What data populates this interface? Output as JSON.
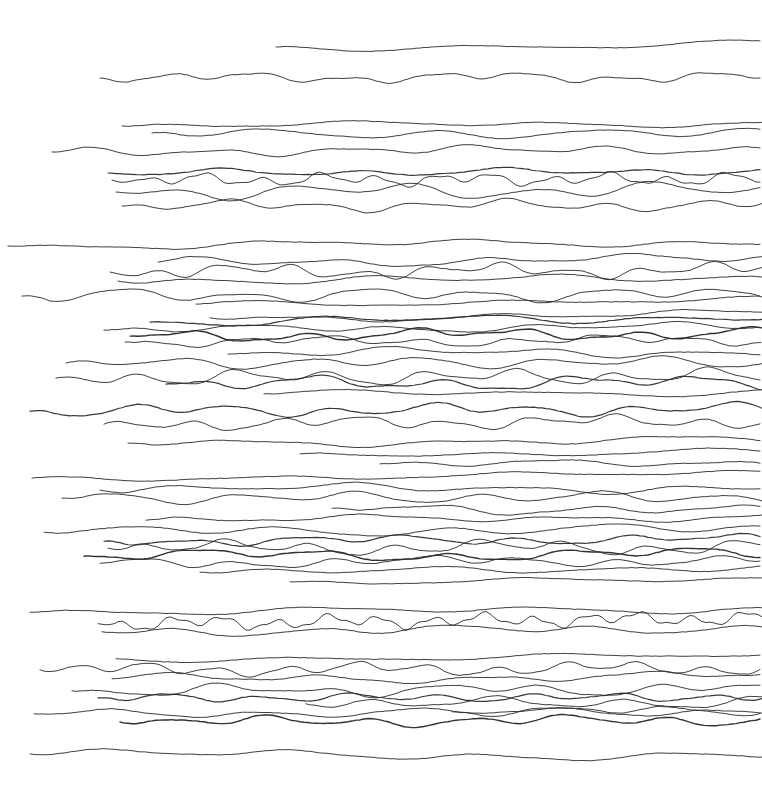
{
  "artwork": {
    "title": "Untitled horizontal line drawing",
    "medium": "pen on paper (abstract horizontal wavy lines)",
    "width": 762,
    "height": 804,
    "background_color": "#ffffff",
    "stroke_color": "#2b2b2b",
    "stroke_width": 1.0,
    "line_count": 55
  },
  "chart_data": {
    "type": "line",
    "xlabel": "",
    "ylabel": "",
    "xlim": [
      0,
      762
    ],
    "ylim": [
      0,
      804
    ],
    "grid": false,
    "legend": null,
    "series": [
      {
        "name": "line-01",
        "x_start": 276,
        "x_end": 762,
        "y": 47,
        "amplitude": 2.5,
        "wavelength": 250,
        "weight": 1.0,
        "slope": -2
      },
      {
        "name": "line-02",
        "x_start": 100,
        "x_end": 762,
        "y": 78,
        "amplitude": 3.0,
        "wavelength": 90,
        "weight": 1.0,
        "slope": -1
      },
      {
        "name": "line-03",
        "x_start": 122,
        "x_end": 762,
        "y": 126,
        "amplitude": 2.0,
        "wavelength": 200,
        "weight": 1.0,
        "slope": -3
      },
      {
        "name": "line-04",
        "x_start": 152,
        "x_end": 762,
        "y": 133,
        "amplitude": 3.5,
        "wavelength": 160,
        "weight": 1.0,
        "slope": 1
      },
      {
        "name": "line-05",
        "x_start": 52,
        "x_end": 762,
        "y": 152,
        "amplitude": 3.0,
        "wavelength": 130,
        "weight": 1.0,
        "slope": -3
      },
      {
        "name": "line-06",
        "x_start": 108,
        "x_end": 762,
        "y": 173,
        "amplitude": 2.5,
        "wavelength": 140,
        "weight": 1.2,
        "slope": -2
      },
      {
        "name": "line-07",
        "x_start": 112,
        "x_end": 762,
        "y": 180,
        "amplitude": 4.0,
        "wavelength": 58,
        "weight": 1.0,
        "slope": -1
      },
      {
        "name": "line-08",
        "x_start": 116,
        "x_end": 762,
        "y": 192,
        "amplitude": 5.0,
        "wavelength": 120,
        "weight": 1.0,
        "slope": -2
      },
      {
        "name": "line-09",
        "x_start": 122,
        "x_end": 762,
        "y": 206,
        "amplitude": 3.5,
        "wavelength": 95,
        "weight": 1.0,
        "slope": -1
      },
      {
        "name": "line-10",
        "x_start": 8,
        "x_end": 762,
        "y": 246,
        "amplitude": 2.5,
        "wavelength": 210,
        "weight": 1.0,
        "slope": -4
      },
      {
        "name": "line-11",
        "x_start": 158,
        "x_end": 762,
        "y": 262,
        "amplitude": 3.0,
        "wavelength": 150,
        "weight": 1.0,
        "slope": -3
      },
      {
        "name": "line-12",
        "x_start": 110,
        "x_end": 762,
        "y": 272,
        "amplitude": 4.0,
        "wavelength": 70,
        "weight": 1.0,
        "slope": -2
      },
      {
        "name": "line-13",
        "x_start": 118,
        "x_end": 762,
        "y": 281,
        "amplitude": 3.0,
        "wavelength": 180,
        "weight": 1.0,
        "slope": -3
      },
      {
        "name": "line-14",
        "x_start": 22,
        "x_end": 762,
        "y": 296,
        "amplitude": 4.5,
        "wavelength": 120,
        "weight": 1.0,
        "slope": -2
      },
      {
        "name": "line-15",
        "x_start": 196,
        "x_end": 762,
        "y": 304,
        "amplitude": 2.0,
        "wavelength": 260,
        "weight": 1.0,
        "slope": -4
      },
      {
        "name": "line-16",
        "x_start": 150,
        "x_end": 762,
        "y": 322,
        "amplitude": 3.0,
        "wavelength": 170,
        "weight": 1.2,
        "slope": -5
      },
      {
        "name": "line-17",
        "x_start": 104,
        "x_end": 762,
        "y": 330,
        "amplitude": 2.5,
        "wavelength": 140,
        "weight": 1.0,
        "slope": -4
      },
      {
        "name": "line-18",
        "x_start": 130,
        "x_end": 762,
        "y": 336,
        "amplitude": 3.5,
        "wavelength": 110,
        "weight": 1.4,
        "slope": -3
      },
      {
        "name": "line-19",
        "x_start": 125,
        "x_end": 762,
        "y": 342,
        "amplitude": 3.0,
        "wavelength": 90,
        "weight": 1.0,
        "slope": -2
      },
      {
        "name": "line-20",
        "x_start": 228,
        "x_end": 762,
        "y": 354,
        "amplitude": 3.0,
        "wavelength": 150,
        "weight": 1.0,
        "slope": -3
      },
      {
        "name": "line-21",
        "x_start": 66,
        "x_end": 762,
        "y": 363,
        "amplitude": 4.0,
        "wavelength": 120,
        "weight": 1.0,
        "slope": -1
      },
      {
        "name": "line-22",
        "x_start": 56,
        "x_end": 762,
        "y": 378,
        "amplitude": 5.0,
        "wavelength": 95,
        "weight": 1.0,
        "slope": -2
      },
      {
        "name": "line-23",
        "x_start": 166,
        "x_end": 762,
        "y": 384,
        "amplitude": 4.5,
        "wavelength": 130,
        "weight": 1.2,
        "slope": -2
      },
      {
        "name": "line-24",
        "x_start": 30,
        "x_end": 762,
        "y": 411,
        "amplitude": 4.0,
        "wavelength": 100,
        "weight": 1.2,
        "slope": -2
      },
      {
        "name": "line-25",
        "x_start": 104,
        "x_end": 762,
        "y": 424,
        "amplitude": 4.0,
        "wavelength": 85,
        "weight": 1.0,
        "slope": -3
      },
      {
        "name": "line-26",
        "x_start": 128,
        "x_end": 762,
        "y": 443,
        "amplitude": 2.5,
        "wavelength": 210,
        "weight": 1.0,
        "slope": -3
      },
      {
        "name": "line-27",
        "x_start": 32,
        "x_end": 762,
        "y": 478,
        "amplitude": 2.0,
        "wavelength": 240,
        "weight": 1.0,
        "slope": -4
      },
      {
        "name": "line-28",
        "x_start": 100,
        "x_end": 762,
        "y": 490,
        "amplitude": 3.0,
        "wavelength": 170,
        "weight": 1.0,
        "slope": -3
      },
      {
        "name": "line-29",
        "x_start": 62,
        "x_end": 762,
        "y": 498,
        "amplitude": 4.0,
        "wavelength": 120,
        "weight": 1.0,
        "slope": -1
      },
      {
        "name": "line-30",
        "x_start": 332,
        "x_end": 762,
        "y": 508,
        "amplitude": 3.5,
        "wavelength": 150,
        "weight": 1.0,
        "slope": 3
      },
      {
        "name": "line-31",
        "x_start": 146,
        "x_end": 762,
        "y": 520,
        "amplitude": 2.5,
        "wavelength": 200,
        "weight": 1.0,
        "slope": -3
      },
      {
        "name": "line-32",
        "x_start": 44,
        "x_end": 762,
        "y": 532,
        "amplitude": 3.5,
        "wavelength": 160,
        "weight": 1.0,
        "slope": -3
      },
      {
        "name": "line-33",
        "x_start": 104,
        "x_end": 762,
        "y": 541,
        "amplitude": 3.0,
        "wavelength": 110,
        "weight": 1.2,
        "slope": -2
      },
      {
        "name": "line-34",
        "x_start": 108,
        "x_end": 762,
        "y": 548,
        "amplitude": 4.5,
        "wavelength": 85,
        "weight": 1.0,
        "slope": -1
      },
      {
        "name": "line-35",
        "x_start": 84,
        "x_end": 762,
        "y": 556,
        "amplitude": 3.5,
        "wavelength": 125,
        "weight": 1.4,
        "slope": -2
      },
      {
        "name": "line-36",
        "x_start": 100,
        "x_end": 762,
        "y": 563,
        "amplitude": 3.0,
        "wavelength": 95,
        "weight": 1.0,
        "slope": -3
      },
      {
        "name": "line-37",
        "x_start": 200,
        "x_end": 762,
        "y": 572,
        "amplitude": 2.5,
        "wavelength": 180,
        "weight": 1.0,
        "slope": -4
      },
      {
        "name": "line-38",
        "x_start": 30,
        "x_end": 762,
        "y": 612,
        "amplitude": 2.5,
        "wavelength": 230,
        "weight": 1.0,
        "slope": -3
      },
      {
        "name": "line-39",
        "x_start": 98,
        "x_end": 762,
        "y": 624,
        "amplitude": 4.5,
        "wavelength": 52,
        "weight": 1.0,
        "slope": -6
      },
      {
        "name": "line-40",
        "x_start": 102,
        "x_end": 762,
        "y": 632,
        "amplitude": 3.0,
        "wavelength": 140,
        "weight": 1.0,
        "slope": -4
      },
      {
        "name": "line-41",
        "x_start": 116,
        "x_end": 762,
        "y": 659,
        "amplitude": 2.0,
        "wavelength": 260,
        "weight": 1.0,
        "slope": -3
      },
      {
        "name": "line-42",
        "x_start": 40,
        "x_end": 762,
        "y": 670,
        "amplitude": 4.0,
        "wavelength": 70,
        "weight": 1.0,
        "slope": -2
      },
      {
        "name": "line-43",
        "x_start": 112,
        "x_end": 762,
        "y": 679,
        "amplitude": 3.0,
        "wavelength": 160,
        "weight": 1.0,
        "slope": -3
      },
      {
        "name": "line-44",
        "x_start": 72,
        "x_end": 762,
        "y": 691,
        "amplitude": 3.5,
        "wavelength": 110,
        "weight": 1.0,
        "slope": -2
      },
      {
        "name": "line-45",
        "x_start": 98,
        "x_end": 762,
        "y": 698,
        "amplitude": 3.0,
        "wavelength": 90,
        "weight": 1.2,
        "slope": -1
      },
      {
        "name": "line-46",
        "x_start": 306,
        "x_end": 762,
        "y": 704,
        "amplitude": 4.0,
        "wavelength": 130,
        "weight": 1.0,
        "slope": -2
      },
      {
        "name": "line-47",
        "x_start": 34,
        "x_end": 762,
        "y": 714,
        "amplitude": 3.0,
        "wavelength": 150,
        "weight": 1.0,
        "slope": -3
      },
      {
        "name": "line-48",
        "x_start": 120,
        "x_end": 762,
        "y": 722,
        "amplitude": 3.5,
        "wavelength": 100,
        "weight": 1.4,
        "slope": -2
      },
      {
        "name": "line-49",
        "x_start": 452,
        "x_end": 762,
        "y": 712,
        "amplitude": 3.0,
        "wavelength": 120,
        "weight": 1.0,
        "slope": -1
      },
      {
        "name": "line-50",
        "x_start": 30,
        "x_end": 762,
        "y": 754,
        "amplitude": 3.0,
        "wavelength": 190,
        "weight": 1.0,
        "slope": 2
      },
      {
        "name": "line-51",
        "x_start": 210,
        "x_end": 762,
        "y": 318,
        "amplitude": 2.5,
        "wavelength": 200,
        "weight": 1.0,
        "slope": -4
      },
      {
        "name": "line-52",
        "x_start": 264,
        "x_end": 762,
        "y": 394,
        "amplitude": 2.0,
        "wavelength": 230,
        "weight": 1.0,
        "slope": -2
      },
      {
        "name": "line-53",
        "x_start": 300,
        "x_end": 762,
        "y": 454,
        "amplitude": 2.0,
        "wavelength": 210,
        "weight": 1.0,
        "slope": -2
      },
      {
        "name": "line-54",
        "x_start": 380,
        "x_end": 762,
        "y": 464,
        "amplitude": 2.5,
        "wavelength": 170,
        "weight": 1.0,
        "slope": -1
      },
      {
        "name": "line-55",
        "x_start": 290,
        "x_end": 762,
        "y": 582,
        "amplitude": 2.0,
        "wavelength": 240,
        "weight": 1.0,
        "slope": -2
      }
    ]
  }
}
